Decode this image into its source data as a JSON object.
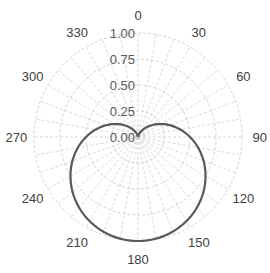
{
  "chart_data": {
    "type": "line",
    "subtype": "polar",
    "title": "",
    "xlabel": "",
    "ylabel": "",
    "angle_direction": "clockwise",
    "zero_location": "top",
    "radial_range": [
      0,
      1
    ],
    "radial_ticks": [
      "0.00",
      "0.25",
      "0.50",
      "0.75",
      "1.00"
    ],
    "angle_ticks": [
      "0",
      "30",
      "60",
      "90",
      "120",
      "150",
      "180",
      "210",
      "240",
      "270",
      "300",
      "330"
    ],
    "grid": {
      "rings": true,
      "spokes_every_deg": 10,
      "style": "dashed"
    },
    "legend": null,
    "series": [
      {
        "name": "pattern",
        "formula": "r = (1 - cos(theta)) / 2",
        "color": "#595959",
        "theta_deg": [
          0,
          30,
          60,
          90,
          120,
          150,
          180,
          210,
          240,
          270,
          300,
          330,
          360
        ],
        "r": [
          0.0,
          0.07,
          0.25,
          0.5,
          0.75,
          0.93,
          1.0,
          0.93,
          0.75,
          0.5,
          0.25,
          0.07,
          0.0
        ]
      }
    ]
  },
  "colors": {
    "grid": "#c8c8c8",
    "curve": "#595959",
    "text": "#404040"
  }
}
